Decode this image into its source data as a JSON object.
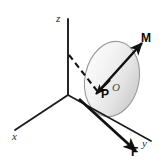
{
  "figure": {
    "background_color": "#ffffff",
    "width": 163,
    "height": 165,
    "axis_labels": {
      "x": "x",
      "y": "y",
      "z": "z"
    },
    "point_labels": {
      "p": "P",
      "o": "O"
    },
    "vector_labels": {
      "moment": "M",
      "force": "F"
    },
    "colors": {
      "line": "#111111",
      "axis": "#1d1d1d",
      "plane_fill_light": "#fbfbfb",
      "plane_fill_dark": "#d8d8d8",
      "plane_stroke": "#9a9a9a",
      "label": "#0a0a0a",
      "axis_label": "#2a2a2a",
      "o_label": "#4a4a4a"
    },
    "elements": {
      "plane": "shaded-ellipse-plane",
      "dashed_line": "hidden-edge-dashed-line",
      "origin": "axis-origin"
    },
    "geometry": {
      "origin": [
        68,
        95
      ],
      "z_axis_tip": [
        68,
        18
      ],
      "x_axis_tip": [
        14,
        130
      ],
      "y_axis_tip": [
        152,
        142
      ],
      "ellipse_center": [
        112,
        79
      ],
      "ellipse_rx": 27,
      "ellipse_ry": 38,
      "ellipse_rotation_deg": 12,
      "m_vector": [
        [
          97,
          93
        ],
        [
          143,
          43
        ]
      ],
      "f_vector": [
        [
          80,
          100
        ],
        [
          137,
          152
        ]
      ],
      "dashed_from": [
        69,
        56
      ],
      "dashed_to": [
        98,
        93
      ]
    }
  }
}
